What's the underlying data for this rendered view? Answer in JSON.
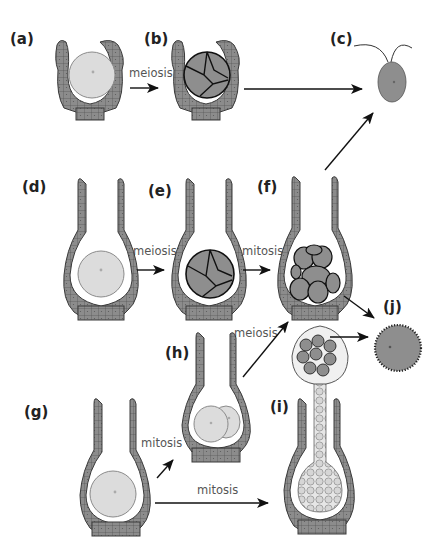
{
  "diagram": {
    "type": "life-cycle schematic",
    "panels": [
      {
        "id": "a",
        "label": "(a)",
        "description": "Short venter-like structure enclosing a single large pale cell"
      },
      {
        "id": "b",
        "label": "(b)",
        "description": "Same structure enclosing four dark cells (tetrad)"
      },
      {
        "id": "c",
        "label": "(c)",
        "description": "Free biflagellate cell"
      },
      {
        "id": "d",
        "label": "(d)",
        "description": "Long-necked flask-shaped structure with single large pale cell"
      },
      {
        "id": "e",
        "label": "(e)",
        "description": "Flask structure with four dark cells"
      },
      {
        "id": "f",
        "label": "(f)",
        "description": "Flask structure with eight dark cells"
      },
      {
        "id": "g",
        "label": "(g)",
        "description": "Flask structure with single large pale cell"
      },
      {
        "id": "h",
        "label": "(h)",
        "description": "Flask structure with two pale cells"
      },
      {
        "id": "i",
        "label": "(i)",
        "description": "Flask structure with multicellular stalked body protruding, containing dark spherical cells at tip"
      },
      {
        "id": "j",
        "label": "(j)",
        "description": "Dark spherical cell with spiny/dotted wall"
      }
    ],
    "arrows": [
      {
        "from": "a",
        "to": "b",
        "label": "meiosis"
      },
      {
        "from": "b",
        "to": "c",
        "label": ""
      },
      {
        "from": "d",
        "to": "e",
        "label": "meiosis"
      },
      {
        "from": "e",
        "to": "f",
        "label": "mitosis"
      },
      {
        "from": "f",
        "to": "c",
        "label": ""
      },
      {
        "from": "f",
        "to": "j",
        "label": ""
      },
      {
        "from": "g",
        "to": "h",
        "label": "mitosis"
      },
      {
        "from": "h",
        "to": "f",
        "label": "meiosis"
      },
      {
        "from": "g",
        "to": "i",
        "label": "mitosis"
      },
      {
        "from": "i",
        "to": "j",
        "label": ""
      }
    ]
  },
  "labels": {
    "a": "(a)",
    "b": "(b)",
    "c": "(c)",
    "d": "(d)",
    "e": "(e)",
    "f": "(f)",
    "g": "(g)",
    "h": "(h)",
    "i": "(i)",
    "j": "(j)"
  },
  "annotations": {
    "ab": "meiosis",
    "de": "meiosis",
    "ef": "mitosis",
    "hf": "meiosis",
    "gh": "mitosis",
    "gi": "mitosis"
  },
  "colors": {
    "wall_fill": "#8c8c8c",
    "wall_stroke": "#3a3a3a",
    "pale_cell": "#dedede",
    "dark_cell": "#8e8e8e",
    "arrow": "#111111",
    "text": "#222222"
  }
}
